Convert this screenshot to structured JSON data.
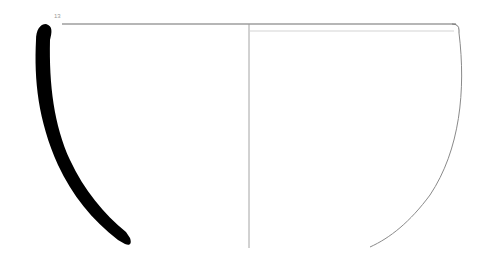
{
  "figure": {
    "type": "pottery-profile-drawing",
    "number_label": "13",
    "colors": {
      "section_fill": "#000000",
      "outline": "#8a8a8a",
      "rim_line": "#6f6f6f",
      "background": "#ffffff"
    }
  }
}
